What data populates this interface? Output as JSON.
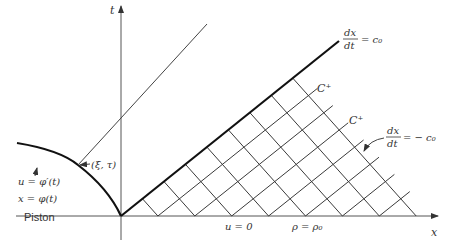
{
  "diagram": {
    "axes": {
      "x_label": "x",
      "t_label": "t"
    },
    "lines": {
      "leading_characteristic": {
        "label_num": "dx",
        "label_den": "dt",
        "label_rhs": "= c₀"
      },
      "backward_characteristic": {
        "label_num": "dx",
        "label_den": "dt",
        "label_rhs": "= − c₀"
      }
    },
    "family_labels": [
      "C⁺",
      "C⁺"
    ],
    "piston": {
      "point_label": "(ξ, τ)",
      "velocity_eq": "u = φ′(t)",
      "position_eq": "x = φ(t)",
      "name": "Piston"
    },
    "region_state": {
      "velocity": "u = 0",
      "density": "ρ = ρ₀"
    }
  }
}
